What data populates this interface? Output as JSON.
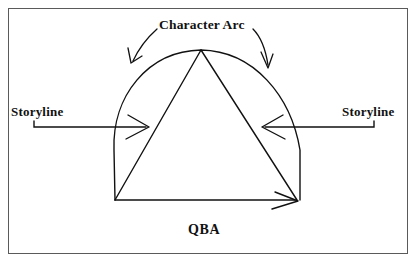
{
  "diagram": {
    "background_color": "#ffffff",
    "ink_color": "#111111",
    "frame_color": "#5a5a5a",
    "labels": {
      "character_arc": "Character Arc",
      "storyline_left": "Storyline",
      "storyline_right": "Storyline",
      "qba": "QBA"
    },
    "shapes": {
      "arch": {
        "name": "character-arc-dome",
        "description": "semicircular dome with near-vertical sides",
        "left_base_x": 115,
        "right_base_x": 300,
        "base_y": 200,
        "apex_x": 201,
        "apex_y": 50
      },
      "triangle": {
        "name": "story-triangle",
        "apex_x": 201,
        "apex_y": 50,
        "bottom_left_x": 115,
        "bottom_left_y": 200,
        "bottom_right_x": 297,
        "bottom_right_y": 200
      },
      "storyline_arrow_left": {
        "from_x": 40,
        "from_y": 127,
        "to_x": 149,
        "to_y": 127,
        "direction": "right"
      },
      "storyline_arrow_right": {
        "from_x": 373,
        "from_y": 127,
        "to_x": 262,
        "to_y": 127,
        "direction": "left"
      },
      "callout_arrow_left": {
        "direction": "down-left",
        "tip_x": 132,
        "tip_y": 63
      },
      "callout_arrow_right": {
        "direction": "down-right",
        "tip_x": 268,
        "tip_y": 68
      },
      "baseline_arrow": {
        "from_x": 115,
        "from_y": 200,
        "to_x": 297,
        "to_y": 200,
        "direction": "right"
      }
    }
  }
}
